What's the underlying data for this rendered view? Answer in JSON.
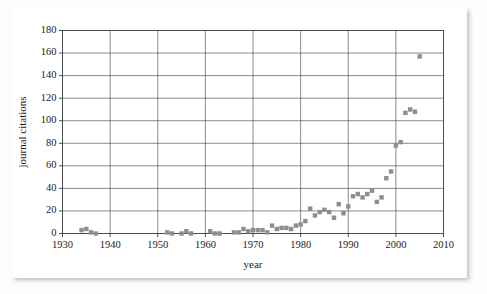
{
  "chart_data": {
    "type": "scatter",
    "title": "",
    "xlabel": "year",
    "ylabel": "journal citations",
    "xlim": [
      1930,
      2010
    ],
    "ylim": [
      0,
      180
    ],
    "xticks": [
      1930,
      1940,
      1950,
      1960,
      1970,
      1980,
      1990,
      2000,
      2010
    ],
    "yticks": [
      0,
      20,
      40,
      60,
      80,
      100,
      120,
      140,
      160,
      180
    ],
    "grid": true,
    "legend": null,
    "marker": {
      "shape": "square",
      "color": "#8d8d8d",
      "size": 2.2
    },
    "x": [
      1934,
      1935,
      1936,
      1937,
      1952,
      1953,
      1955,
      1956,
      1957,
      1961,
      1962,
      1963,
      1966,
      1967,
      1968,
      1969,
      1970,
      1971,
      1972,
      1973,
      1974,
      1975,
      1976,
      1977,
      1978,
      1979,
      1980,
      1981,
      1982,
      1983,
      1984,
      1985,
      1986,
      1987,
      1988,
      1989,
      1990,
      1991,
      1992,
      1993,
      1994,
      1995,
      1996,
      1997,
      1998,
      1999,
      2000,
      2001,
      2002,
      2003,
      2004,
      2005
    ],
    "y": [
      3,
      4,
      1,
      0,
      1,
      0,
      0,
      2,
      0,
      2,
      0,
      0,
      1,
      1,
      4,
      2,
      3,
      3,
      3,
      1,
      7,
      4,
      5,
      5,
      4,
      7,
      8,
      11,
      22,
      16,
      19,
      21,
      19,
      14,
      26,
      18,
      24,
      33,
      35,
      32,
      35,
      38,
      28,
      32,
      49,
      55,
      78,
      81,
      107,
      110,
      108,
      157
    ],
    "points": [
      {
        "year": 1934,
        "citations": 3
      },
      {
        "year": 1935,
        "citations": 4
      },
      {
        "year": 1936,
        "citations": 1
      },
      {
        "year": 1937,
        "citations": 0
      },
      {
        "year": 1952,
        "citations": 1
      },
      {
        "year": 1953,
        "citations": 0
      },
      {
        "year": 1955,
        "citations": 0
      },
      {
        "year": 1956,
        "citations": 2
      },
      {
        "year": 1957,
        "citations": 0
      },
      {
        "year": 1961,
        "citations": 2
      },
      {
        "year": 1962,
        "citations": 0
      },
      {
        "year": 1963,
        "citations": 0
      },
      {
        "year": 1966,
        "citations": 1
      },
      {
        "year": 1967,
        "citations": 1
      },
      {
        "year": 1968,
        "citations": 4
      },
      {
        "year": 1969,
        "citations": 2
      },
      {
        "year": 1970,
        "citations": 3
      },
      {
        "year": 1971,
        "citations": 3
      },
      {
        "year": 1972,
        "citations": 3
      },
      {
        "year": 1973,
        "citations": 1
      },
      {
        "year": 1974,
        "citations": 7
      },
      {
        "year": 1975,
        "citations": 4
      },
      {
        "year": 1976,
        "citations": 5
      },
      {
        "year": 1977,
        "citations": 5
      },
      {
        "year": 1978,
        "citations": 4
      },
      {
        "year": 1979,
        "citations": 7
      },
      {
        "year": 1980,
        "citations": 8
      },
      {
        "year": 1981,
        "citations": 11
      },
      {
        "year": 1982,
        "citations": 22
      },
      {
        "year": 1983,
        "citations": 16
      },
      {
        "year": 1984,
        "citations": 19
      },
      {
        "year": 1985,
        "citations": 21
      },
      {
        "year": 1986,
        "citations": 19
      },
      {
        "year": 1987,
        "citations": 14
      },
      {
        "year": 1988,
        "citations": 26
      },
      {
        "year": 1989,
        "citations": 18
      },
      {
        "year": 1990,
        "citations": 24
      },
      {
        "year": 1991,
        "citations": 33
      },
      {
        "year": 1992,
        "citations": 35
      },
      {
        "year": 1993,
        "citations": 32
      },
      {
        "year": 1994,
        "citations": 35
      },
      {
        "year": 1995,
        "citations": 38
      },
      {
        "year": 1996,
        "citations": 28
      },
      {
        "year": 1997,
        "citations": 32
      },
      {
        "year": 1998,
        "citations": 49
      },
      {
        "year": 1999,
        "citations": 55
      },
      {
        "year": 2000,
        "citations": 78
      },
      {
        "year": 2001,
        "citations": 81
      },
      {
        "year": 2002,
        "citations": 107
      },
      {
        "year": 2003,
        "citations": 110
      },
      {
        "year": 2004,
        "citations": 108
      },
      {
        "year": 2005,
        "citations": 157
      }
    ]
  }
}
